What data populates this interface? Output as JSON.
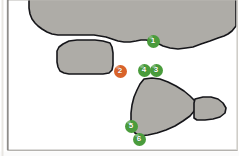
{
  "figure": {
    "background_color": "#ffffff",
    "frame": {
      "border_color": "#b9b7b3",
      "left_rule_color": "#7d7b78",
      "shadow_color": "#cfcdc9"
    },
    "regions": [
      {
        "id": "region-top",
        "name": "upper-landmass-region",
        "fill": "#aeaca7",
        "stroke": "#16161a",
        "stroke_width": 1.6,
        "path": "M 31 -14 L 236 -14 L 236 26 L 232 31 L 228 34 L 224 36 L 218 38 L 210 41 L 201 44 L 193 47 L 186 48 L 178 49 L 170 48 L 163 46 L 157 43 L 151 41 L 146 40 L 141 40 L 136 41 L 130 42 L 124 42 L 118 41 L 112 39 L 106 37 L 100 36 L 94 35 L 88 35 L 82 35 L 76 35 L 70 35 L 64 35 L 58 35 L 52 34 L 47 32 L 42 29 L 38 26 L 35 23 L 32 19 L 30 14 L 29 8 L 29 1 Z"
      },
      {
        "id": "region-middle",
        "name": "rounded-plateau-region",
        "fill": "#aeaca7",
        "stroke": "#16161a",
        "stroke_width": 1.6,
        "path": "M 63 44 L 69 41 L 77 40 L 86 40 L 95 40 L 103 41 L 110 43 L 112 47 L 113 53 L 113 59 L 113 65 L 112 70 L 109 73 L 103 74 L 96 74 L 89 74 L 82 74 L 75 74 L 69 74 L 64 73 L 60 71 L 58 67 L 57 62 L 57 56 L 57 51 L 59 47 Z"
      },
      {
        "id": "region-triangle",
        "name": "triangular-headland-region",
        "fill": "#aeaca7",
        "stroke": "#16161a",
        "stroke_width": 1.6,
        "path": "M 144 79 L 152 78 L 160 79 L 168 82 L 176 86 L 184 91 L 190 96 L 195 101 L 195 110 L 190 116 L 183 121 L 175 126 L 166 130 L 157 133 L 148 135 L 140 136 L 135 133 L 132 128 L 131 121 L 131 113 L 132 105 L 134 97 L 137 90 L 140 84 Z"
      },
      {
        "id": "region-tail",
        "name": "eastern-spur-region",
        "fill": "#aeaca7",
        "stroke": "#16161a",
        "stroke_width": 1.6,
        "path": "M 195 99 L 203 97 L 211 97 L 218 99 L 223 103 L 226 108 L 225 113 L 220 117 L 213 119 L 205 120 L 197 120 L 194 118 L 194 110 L 194 103 Z"
      }
    ],
    "markers": [
      {
        "id": "marker-1",
        "label": "1",
        "color": "#4a9c3c",
        "x": 153,
        "y": 41
      },
      {
        "id": "marker-2",
        "label": "2",
        "color": "#d9632a",
        "x": 120,
        "y": 71
      },
      {
        "id": "marker-3",
        "label": "3",
        "color": "#4a9c3c",
        "x": 156,
        "y": 70
      },
      {
        "id": "marker-4",
        "label": "4",
        "color": "#4a9c3c",
        "x": 144,
        "y": 70
      },
      {
        "id": "marker-5",
        "label": "5",
        "color": "#4a9c3c",
        "x": 131,
        "y": 126
      },
      {
        "id": "marker-6",
        "label": "6",
        "color": "#4a9c3c",
        "x": 139,
        "y": 139
      }
    ]
  }
}
